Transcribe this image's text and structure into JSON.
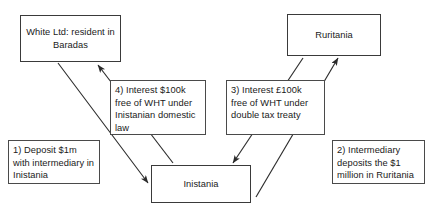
{
  "diagram": {
    "type": "flow-diagram",
    "nodes": [
      {
        "id": "white-ltd",
        "label": "White Ltd: resident in Baradas"
      },
      {
        "id": "ruritania",
        "label": "Ruritania"
      },
      {
        "id": "inistania",
        "label": "Inistania"
      }
    ],
    "notes": [
      {
        "id": "step-1",
        "label": "1) Deposit $1m with intermediary in Inistania"
      },
      {
        "id": "step-2",
        "label": "2) Intermediary deposits the $1 million in Ruritania"
      },
      {
        "id": "step-3",
        "label": "3) Interest £100k free of WHT under double tax treaty"
      },
      {
        "id": "step-4",
        "label": "4) Interest $100k free of WHT under Inistanian domestic law"
      }
    ],
    "edges": [
      {
        "id": "edge-1",
        "from": "white-ltd",
        "to": "inistania",
        "note": "step-1"
      },
      {
        "id": "edge-2",
        "from": "inistania",
        "to": "ruritania",
        "note": "step-2"
      },
      {
        "id": "edge-3",
        "from": "ruritania",
        "to": "inistania",
        "note": "step-3"
      },
      {
        "id": "edge-4",
        "from": "inistania",
        "to": "white-ltd",
        "note": "step-4"
      }
    ],
    "colors": {
      "background": "#ffffff",
      "box_border": "#3a3a3a",
      "arrow": "#2b2b2b",
      "text": "#1a1a1a"
    }
  }
}
